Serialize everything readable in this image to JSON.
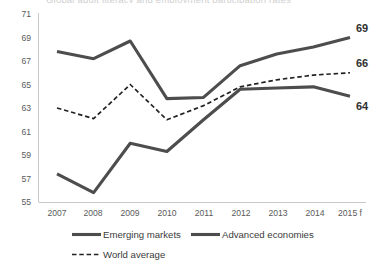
{
  "title_clipped": "Global adult literacy and employment participation rates",
  "chart_data": {
    "type": "line",
    "title": "",
    "xlabel": "",
    "ylabel": "",
    "x": [
      "2007",
      "2008",
      "2009",
      "2010",
      "2011",
      "2012",
      "2013",
      "2014",
      "2015 f"
    ],
    "categories": [
      "2007",
      "2008",
      "2009",
      "2010",
      "2011",
      "2012",
      "2013",
      "2014",
      "2015 f"
    ],
    "ylim": [
      55,
      71
    ],
    "yticks": [
      55,
      57,
      59,
      61,
      63,
      65,
      67,
      69,
      71
    ],
    "grid": false,
    "legend_position": "bottom-left",
    "series": [
      {
        "name": "Emerging markets",
        "style": "solid",
        "color": "#4d4d4d",
        "values": [
          67.8,
          67.2,
          68.7,
          63.8,
          63.9,
          66.6,
          67.6,
          68.2,
          69.0
        ],
        "end_label": "69"
      },
      {
        "name": "Advanced economies",
        "style": "solid",
        "color": "#4d4d4d",
        "values": [
          57.4,
          55.8,
          60.0,
          59.3,
          62.0,
          64.6,
          64.7,
          64.8,
          64.0
        ],
        "end_label": "64"
      },
      {
        "name": "World average",
        "style": "dashed",
        "color": "#222222",
        "values": [
          63.0,
          62.1,
          65.0,
          62.0,
          63.2,
          64.8,
          65.4,
          65.8,
          66.0
        ],
        "end_label": "66"
      }
    ],
    "end_labels": [
      {
        "text": "69",
        "series": "Emerging markets"
      },
      {
        "text": "66",
        "series": "World average"
      },
      {
        "text": "64",
        "series": "Advanced economies"
      }
    ]
  },
  "legend": {
    "items": [
      {
        "label": "Emerging markets",
        "style": "solid"
      },
      {
        "label": "Advanced economies",
        "style": "solid"
      },
      {
        "label": "World average",
        "style": "dashed"
      }
    ]
  }
}
